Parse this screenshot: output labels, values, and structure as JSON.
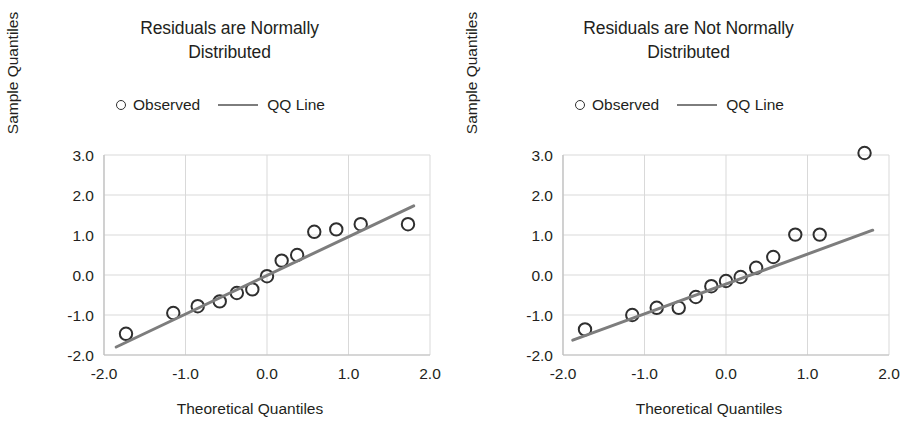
{
  "figure": {
    "width": 918,
    "height": 434,
    "background": "#ffffff"
  },
  "style": {
    "line_color": "#7d7d7d",
    "marker_color": "#2f2f2f",
    "grid_color": "#d9d9d9",
    "axis_color": "#bfbfbf",
    "text_color": "#231f20"
  },
  "legend": {
    "marker_icon": "open-circle-icon",
    "observed_label": "Observed",
    "line_icon": "line-segment-icon",
    "qq_line_label": "QQ Line"
  },
  "panels": [
    {
      "id": "left",
      "title_line1": "Residuals are Normally",
      "title_line2": "Distributed"
    },
    {
      "id": "right",
      "title_line1": "Residuals are Not Normally",
      "title_line2": "Distributed"
    }
  ],
  "chart_data": [
    {
      "type": "scatter",
      "panel": "left",
      "title": "Residuals are Normally Distributed",
      "xlabel": "Theoretical Quantiles",
      "ylabel": "Sample Quantiles",
      "xlim": [
        -2.0,
        2.0
      ],
      "ylim": [
        -2.0,
        3.0
      ],
      "xticks": [
        -2.0,
        -1.0,
        0.0,
        1.0,
        2.0
      ],
      "yticks": [
        -2.0,
        -1.0,
        0.0,
        1.0,
        2.0,
        3.0
      ],
      "xticklabels": [
        "-2.0",
        "-1.0",
        "0.0",
        "1.0",
        "2.0"
      ],
      "yticklabels": [
        "-2.0",
        "-1.0",
        "0.0",
        "1.0",
        "2.0",
        "3.0"
      ],
      "grid": true,
      "legend_position": "above-axes-center",
      "series": [
        {
          "name": "Observed",
          "marker": "open-circle",
          "x": [
            -1.73,
            -1.15,
            -0.85,
            -0.58,
            -0.37,
            -0.18,
            0.0,
            0.18,
            0.37,
            0.58,
            0.85,
            1.15,
            1.73
          ],
          "y": [
            -1.47,
            -0.95,
            -0.78,
            -0.66,
            -0.45,
            -0.36,
            -0.03,
            0.36,
            0.5,
            1.08,
            1.14,
            1.27,
            1.27
          ]
        },
        {
          "name": "QQ Line",
          "type": "line",
          "x": [
            -1.85,
            1.8
          ],
          "y": [
            -1.8,
            1.73
          ]
        }
      ]
    },
    {
      "type": "scatter",
      "panel": "right",
      "title": "Residuals are Not Normally Distributed",
      "xlabel": "Theoretical Quantiles",
      "ylabel": "Sample Quantiles",
      "xlim": [
        -2.0,
        2.0
      ],
      "ylim": [
        -2.0,
        3.0
      ],
      "xticks": [
        -2.0,
        -1.0,
        0.0,
        1.0,
        2.0
      ],
      "yticks": [
        -2.0,
        -1.0,
        0.0,
        1.0,
        2.0,
        3.0
      ],
      "xticklabels": [
        "-2.0",
        "-1.0",
        "0.0",
        "1.0",
        "2.0"
      ],
      "yticklabels": [
        "-2.0",
        "-1.0",
        "0.0",
        "1.0",
        "2.0",
        "3.0"
      ],
      "grid": true,
      "legend_position": "above-axes-center",
      "series": [
        {
          "name": "Observed",
          "marker": "open-circle",
          "x": [
            -1.73,
            -1.15,
            -0.85,
            -0.58,
            -0.37,
            -0.18,
            0.0,
            0.18,
            0.37,
            0.58,
            0.85,
            1.15,
            1.7
          ],
          "y": [
            -1.36,
            -1.0,
            -0.82,
            -0.82,
            -0.55,
            -0.28,
            -0.15,
            -0.05,
            0.18,
            0.45,
            1.01,
            1.01,
            3.05
          ]
        },
        {
          "name": "QQ Line",
          "type": "line",
          "x": [
            -1.88,
            1.8
          ],
          "y": [
            -1.63,
            1.12
          ]
        }
      ]
    }
  ]
}
